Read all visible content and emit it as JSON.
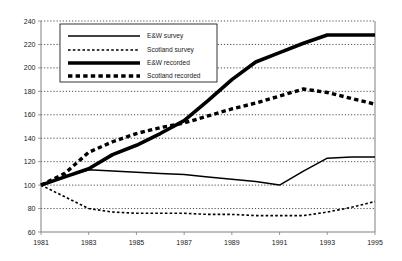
{
  "chart_data": {
    "type": "line",
    "title": "",
    "subtitle": "",
    "xlabel": "",
    "ylabel": "",
    "x": [
      1981,
      1982,
      1983,
      1984,
      1985,
      1986,
      1987,
      1988,
      1989,
      1990,
      1991,
      1992,
      1993,
      1994,
      1995
    ],
    "xlim": [
      1981,
      1995
    ],
    "ylim": [
      60,
      240
    ],
    "y_ticks": [
      60,
      80,
      100,
      120,
      140,
      160,
      180,
      200,
      220,
      240
    ],
    "x_ticks": [
      1981,
      1983,
      1985,
      1987,
      1989,
      1991,
      1993,
      1995
    ],
    "x_tick_labels": [
      "1981",
      "1983",
      "1985",
      "1987",
      "1989",
      "1991",
      "1993",
      "1995"
    ],
    "y_tick_labels": [
      "60",
      "80",
      "100",
      "120",
      "140",
      "160",
      "180",
      "200",
      "220",
      "240"
    ],
    "grid": true,
    "grid_axis": "y",
    "legend_position": "top-left-inside",
    "series": [
      {
        "name": "E&W survey",
        "style": "thin-solid",
        "color": "#000000",
        "values": [
          100,
          107,
          113,
          112,
          111,
          110,
          109,
          107,
          105,
          103,
          100,
          112,
          123,
          124,
          124
        ]
      },
      {
        "name": "Scotland survey",
        "style": "thin-dotted",
        "color": "#000000",
        "values": [
          100,
          90,
          80,
          77,
          76,
          76,
          76,
          75,
          75,
          74,
          74,
          74,
          77,
          81,
          86
        ]
      },
      {
        "name": "E&W recorded",
        "style": "thick-solid",
        "color": "#000000",
        "values": [
          100,
          107,
          114,
          126,
          134,
          144,
          155,
          172,
          190,
          205,
          213,
          221,
          228,
          228,
          228
        ]
      },
      {
        "name": "Scotland recorded",
        "style": "thick-dashed",
        "color": "#000000",
        "values": [
          100,
          110,
          128,
          137,
          144,
          149,
          153,
          159,
          165,
          170,
          176,
          182,
          179,
          174,
          169
        ]
      }
    ]
  }
}
